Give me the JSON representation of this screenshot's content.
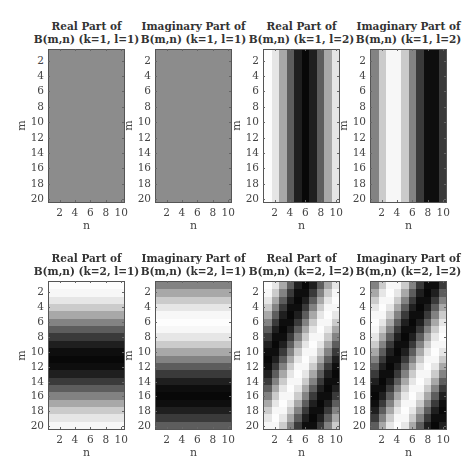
{
  "chart_data": {
    "type": "heatmap",
    "colormap": "gray",
    "M": 20,
    "N": 10,
    "panels": [
      {
        "title_line1": "Real Part of",
        "title_line2": "B(m,n) (k=1, l=1)",
        "part": "real",
        "k": 1,
        "l": 1
      },
      {
        "title_line1": "Imaginary Part of",
        "title_line2": "B(m,n) (k=1, l=1)",
        "part": "imag",
        "k": 1,
        "l": 1
      },
      {
        "title_line1": "Real Part of",
        "title_line2": "B(m,n) (k=1, l=2)",
        "part": "real",
        "k": 1,
        "l": 2
      },
      {
        "title_line1": "Imaginary Part of",
        "title_line2": "B(m,n) (k=1, l=2)",
        "part": "imag",
        "k": 1,
        "l": 2
      },
      {
        "title_line1": "Real Part of",
        "title_line2": "B(m,n) (k=2, l=1)",
        "part": "real",
        "k": 2,
        "l": 1
      },
      {
        "title_line1": "Imaginary Part of",
        "title_line2": "B(m,n) (k=2, l=1)",
        "part": "imag",
        "k": 2,
        "l": 1
      },
      {
        "title_line1": "Real Part of",
        "title_line2": "B(m,n) (k=2, l=2)",
        "part": "real",
        "k": 2,
        "l": 2
      },
      {
        "title_line1": "Imaginary Part of",
        "title_line2": "B(m,n) (k=2, l=2)",
        "part": "imag",
        "k": 2,
        "l": 2
      }
    ],
    "xlabel": "n",
    "ylabel": "m",
    "xticks": [
      "2",
      "4",
      "6",
      "8",
      "10"
    ],
    "yticks": [
      "2",
      "4",
      "6",
      "8",
      "10",
      "12",
      "14",
      "16",
      "18",
      "20"
    ],
    "xlim": [
      0.5,
      10.5
    ],
    "ylim": [
      0.5,
      20.5
    ],
    "grid": false,
    "constant_panel_gray": "#8c8c8c"
  }
}
